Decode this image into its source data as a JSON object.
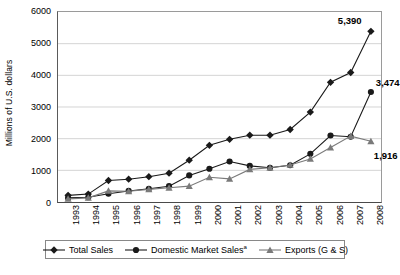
{
  "chart_data": {
    "type": "line",
    "title": "",
    "xlabel": "",
    "ylabel": "Millions of U.S. dollars",
    "ylim": [
      0,
      6000
    ],
    "y_ticks": [
      0,
      1000,
      2000,
      3000,
      4000,
      5000,
      6000
    ],
    "y_tick_labels": [
      "0",
      "1000",
      "2000",
      "3000",
      "4000",
      "5000",
      "6000"
    ],
    "grid": "horizontal",
    "legend_position": "bottom",
    "categories": [
      "1993",
      "1994",
      "1995",
      "1996",
      "1997",
      "1998",
      "1999",
      "2000",
      "2001",
      "2002",
      "2003",
      "2004",
      "2005",
      "2006",
      "2007",
      "2008"
    ],
    "series": [
      {
        "name": "Total Sales",
        "marker": "diamond",
        "color": "#1a1a1a",
        "values": [
          210,
          250,
          680,
          720,
          800,
          910,
          1320,
          1790,
          1980,
          2110,
          2110,
          2290,
          2840,
          3780,
          4090,
          5390
        ]
      },
      {
        "name": "Domestic Market Sales",
        "name_superscript": "a",
        "marker": "circle",
        "color": "#1a1a1a",
        "values": [
          130,
          150,
          260,
          350,
          420,
          500,
          840,
          1050,
          1280,
          1140,
          1080,
          1160,
          1520,
          2100,
          2060,
          3474
        ]
      },
      {
        "name": "Exports (G & S)",
        "marker": "triangle",
        "color": "#7a7a7a",
        "values": [
          100,
          130,
          350,
          340,
          400,
          450,
          500,
          780,
          730,
          1030,
          1080,
          1170,
          1360,
          1720,
          2080,
          1916
        ]
      }
    ],
    "annotations": [
      {
        "text": "5,390",
        "series": "Total Sales",
        "category": "2008",
        "value": 5390
      },
      {
        "text": "3,474",
        "series": "Domestic Market Sales",
        "category": "2008",
        "value": 3474
      },
      {
        "text": "1,916",
        "series": "Exports (G & S)",
        "category": "2008",
        "value": 1916
      }
    ]
  },
  "legend": {
    "items": [
      {
        "label": "Total Sales",
        "superscript": ""
      },
      {
        "label": "Domestic Market Sales",
        "superscript": "a"
      },
      {
        "label": "Exports (G & S)",
        "superscript": ""
      }
    ]
  },
  "footer": {
    "note": ""
  }
}
